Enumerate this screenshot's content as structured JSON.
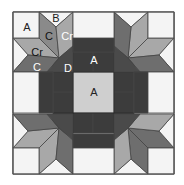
{
  "diagram": {
    "colors": {
      "light": "#f4f4f4",
      "center_light": "#c9c9c9",
      "dark": "#3c3c3c",
      "dark_alt": "#444444",
      "medium": "#777777",
      "medium_light": "#9a9a9a",
      "outline": "#444444"
    },
    "labels": {
      "A_corner": "A",
      "B": "B",
      "C_top": "C",
      "Cr_top": "Cr",
      "Cr_left": "Cr",
      "C_left": "C",
      "D": "D",
      "A_top_center": "A",
      "A_center": "A"
    }
  }
}
